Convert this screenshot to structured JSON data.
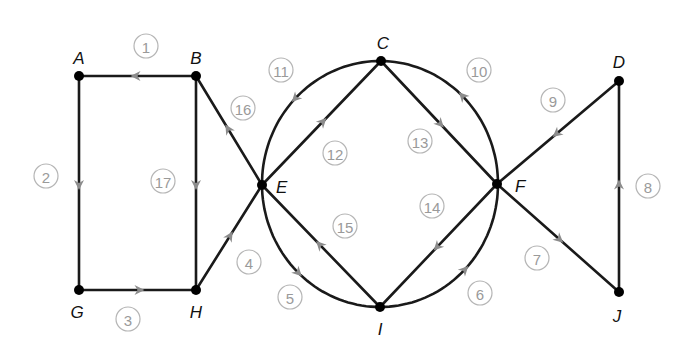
{
  "diagram": {
    "type": "directed-graph",
    "nodes": [
      {
        "id": "A",
        "label": "A",
        "x": 79,
        "y": 76,
        "lx": 79,
        "ly": 64,
        "anchor": "middle"
      },
      {
        "id": "B",
        "label": "B",
        "x": 196,
        "y": 76,
        "lx": 196,
        "ly": 64,
        "anchor": "middle"
      },
      {
        "id": "C",
        "label": "C",
        "x": 381,
        "y": 61,
        "lx": 383,
        "ly": 49,
        "anchor": "middle"
      },
      {
        "id": "D",
        "label": "D",
        "x": 619,
        "y": 81,
        "lx": 619,
        "ly": 68,
        "anchor": "middle"
      },
      {
        "id": "E",
        "label": "E",
        "x": 262,
        "y": 185,
        "lx": 276,
        "ly": 193,
        "anchor": "start"
      },
      {
        "id": "F",
        "label": "F",
        "x": 497,
        "y": 184,
        "lx": 515,
        "ly": 192,
        "anchor": "start"
      },
      {
        "id": "G",
        "label": "G",
        "x": 79,
        "y": 290,
        "lx": 77,
        "ly": 318,
        "anchor": "middle"
      },
      {
        "id": "H",
        "label": "H",
        "x": 196,
        "y": 290,
        "lx": 196,
        "ly": 318,
        "anchor": "middle"
      },
      {
        "id": "I",
        "label": "I",
        "x": 380,
        "y": 307,
        "lx": 380,
        "ly": 335,
        "anchor": "middle"
      },
      {
        "id": "J",
        "label": "J",
        "x": 619,
        "y": 292,
        "lx": 617,
        "ly": 322,
        "anchor": "middle"
      }
    ],
    "edges": [
      {
        "id": 1,
        "label": "1",
        "from": "B",
        "to": "A",
        "shape": "line",
        "lx": 146,
        "ly": 46
      },
      {
        "id": 2,
        "label": "2",
        "from": "A",
        "to": "G",
        "shape": "line",
        "lx": 46,
        "ly": 176
      },
      {
        "id": 3,
        "label": "3",
        "from": "G",
        "to": "H",
        "shape": "line",
        "lx": 128,
        "ly": 319
      },
      {
        "id": 4,
        "label": "4",
        "from": "H",
        "to": "E",
        "shape": "line",
        "lx": 249,
        "ly": 262
      },
      {
        "id": 5,
        "label": "5",
        "from": "E",
        "to": "I",
        "shape": "arc",
        "sweep": 0,
        "lx": 290,
        "ly": 297
      },
      {
        "id": 6,
        "label": "6",
        "from": "I",
        "to": "F",
        "shape": "arc",
        "sweep": 0,
        "lx": 480,
        "ly": 293
      },
      {
        "id": 7,
        "label": "7",
        "from": "F",
        "to": "J",
        "shape": "line",
        "lx": 537,
        "ly": 258
      },
      {
        "id": 8,
        "label": "8",
        "from": "J",
        "to": "D",
        "shape": "line",
        "lx": 648,
        "ly": 186
      },
      {
        "id": 9,
        "label": "9",
        "from": "D",
        "to": "F",
        "shape": "line",
        "lx": 553,
        "ly": 100
      },
      {
        "id": 10,
        "label": "10",
        "from": "F",
        "to": "C",
        "shape": "arc",
        "sweep": 0,
        "lx": 479,
        "ly": 70
      },
      {
        "id": 11,
        "label": "11",
        "from": "C",
        "to": "E",
        "shape": "arc",
        "sweep": 0,
        "lx": 281,
        "ly": 70
      },
      {
        "id": 12,
        "label": "12",
        "from": "E",
        "to": "C",
        "shape": "line",
        "lx": 335,
        "ly": 153
      },
      {
        "id": 13,
        "label": "13",
        "from": "C",
        "to": "F",
        "shape": "line",
        "lx": 420,
        "ly": 141
      },
      {
        "id": 14,
        "label": "14",
        "from": "F",
        "to": "I",
        "shape": "line",
        "lx": 432,
        "ly": 206
      },
      {
        "id": 15,
        "label": "15",
        "from": "I",
        "to": "E",
        "shape": "line",
        "lx": 345,
        "ly": 226
      },
      {
        "id": 16,
        "label": "16",
        "from": "E",
        "to": "B",
        "shape": "line",
        "lx": 243,
        "ly": 108
      },
      {
        "id": 17,
        "label": "17",
        "from": "B",
        "to": "H",
        "shape": "line",
        "lx": 163,
        "ly": 181
      }
    ],
    "circle": {
      "cx": 380,
      "cy": 184,
      "rx": 118,
      "ry": 123
    },
    "colors": {
      "edge": "#1a1a1a",
      "arrow": "#8c8c8c",
      "node": "#000000",
      "label_circle": "#b5b5b5",
      "label_text": "#9a9a9a"
    }
  }
}
